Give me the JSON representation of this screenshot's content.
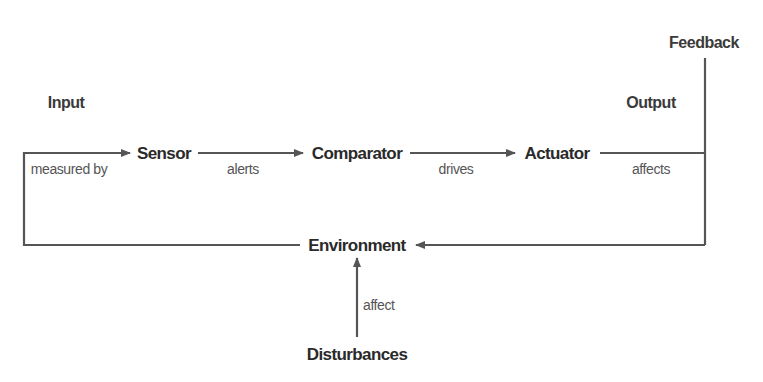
{
  "diagram": {
    "colors": {
      "line": "#555555",
      "node_text": "#2a2a2a",
      "edge_text": "#555555",
      "background": "#ffffff"
    },
    "sections": {
      "input": "Input",
      "output": "Output",
      "feedback": "Feedback"
    },
    "nodes": [
      {
        "id": "sensor",
        "label": "Sensor"
      },
      {
        "id": "comparator",
        "label": "Comparator"
      },
      {
        "id": "actuator",
        "label": "Actuator"
      },
      {
        "id": "environment",
        "label": "Environment"
      },
      {
        "id": "disturbances",
        "label": "Disturbances"
      }
    ],
    "edges": [
      {
        "from": "environment",
        "to": "sensor",
        "label": "measured by"
      },
      {
        "from": "sensor",
        "to": "comparator",
        "label": "alerts"
      },
      {
        "from": "comparator",
        "to": "actuator",
        "label": "drives"
      },
      {
        "from": "actuator",
        "to": "environment",
        "label": "affects"
      },
      {
        "from": "disturbances",
        "to": "environment",
        "label": "affect"
      }
    ]
  }
}
